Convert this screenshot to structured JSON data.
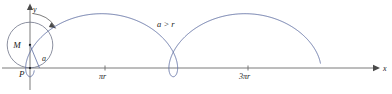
{
  "figure": {
    "kind": "prolate-cycloid-diagram",
    "background_color": "#ffffff",
    "curve_color": "#5c6ca0",
    "axis_color": "#6b6b6b",
    "circle_color": "#6f7488",
    "width": 392,
    "height": 94,
    "annotation": "a > r",
    "labels": {
      "y_axis": "y",
      "x_axis": "x",
      "center": "M",
      "tracing_point": "P",
      "angle": "a"
    },
    "ticks": [
      {
        "label": "πr",
        "x": 105
      },
      {
        "label": "3πr",
        "x": 248
      }
    ]
  },
  "chart_data": {
    "type": "line",
    "title": "",
    "subtitle": "",
    "xlabel": "x",
    "ylabel": "y",
    "grid": false,
    "legend": false,
    "annotations": [
      {
        "text": "a > r",
        "x": 175,
        "y": 24
      },
      {
        "text": "M",
        "x": 18,
        "y": 42
      },
      {
        "text": "P",
        "x": 16,
        "y": 76
      },
      {
        "text": "a",
        "x": 44,
        "y": 60
      }
    ],
    "axis_ticks": {
      "x_tick_labels": [
        "πr",
        "3πr"
      ],
      "x_tick_positions": [
        105,
        248
      ],
      "y_tick_labels": [],
      "y_tick_positions": []
    },
    "series": [
      {
        "name": "prolate cycloid",
        "description": "x = r*t - a*sin(t), y = r - a*cos(t) with a > r",
        "parameters": {
          "r": 22.8,
          "a": 31.5,
          "origin_x": 30,
          "baseline_y": 68
        },
        "t_range": [
          -0.62,
          11.6
        ],
        "key_points": [
          {
            "t": 0,
            "x": 30,
            "y": 76.5,
            "note": "P cusp below axis"
          },
          {
            "t": 3.1416,
            "x": 101.6,
            "y": 8.5,
            "note": "arch apex"
          },
          {
            "t": 6.2832,
            "x": 173.3,
            "y": 76.5,
            "note": "loop low point"
          },
          {
            "t": 9.4248,
            "x": 245,
            "y": 8.5,
            "note": "arch apex"
          },
          {
            "t": 12.566,
            "x": 316.6,
            "y": 76.5,
            "note": "loop low point"
          }
        ]
      }
    ],
    "rolling_circle": {
      "center": {
        "x": 30,
        "y": 45
      },
      "radius": 22.8,
      "rotation_direction": "clockwise"
    },
    "xlim": [
      0,
      392
    ],
    "ylim": [
      94,
      0
    ]
  }
}
